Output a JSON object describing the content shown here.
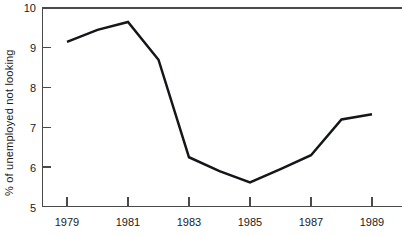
{
  "chart_data": {
    "type": "line",
    "title": "",
    "subtitle": "",
    "xlabel": "",
    "ylabel": "% of unemployed not looking",
    "xlim": [
      1978.5,
      1989.8
    ],
    "ylim": [
      5,
      10
    ],
    "grid": false,
    "legend": "none",
    "x_tick_labels": [
      "1979",
      "1981",
      "1983",
      "1985",
      "1987",
      "1989"
    ],
    "x_tick_values": [
      1979,
      1981,
      1983,
      1985,
      1987,
      1989
    ],
    "y_tick_labels": [
      "5",
      "6",
      "7",
      "8",
      "9",
      "10"
    ],
    "y_tick_values": [
      5,
      6,
      7,
      8,
      9,
      10
    ],
    "series": [
      {
        "name": "% of unemployed not looking",
        "color": "#15161a",
        "x": [
          1979,
          1980,
          1981,
          1982,
          1983,
          1984,
          1985,
          1986,
          1987,
          1988,
          1989
        ],
        "values": [
          9.15,
          9.45,
          9.65,
          8.7,
          6.25,
          5.9,
          5.62,
          5.95,
          6.3,
          7.2,
          7.33
        ]
      }
    ]
  },
  "axes": {
    "y_axis_label": "% of unemployed not looking",
    "y_ticks": [
      {
        "label": "10",
        "value": 10
      },
      {
        "label": "9",
        "value": 9
      },
      {
        "label": "8",
        "value": 8
      },
      {
        "label": "7",
        "value": 7
      },
      {
        "label": "6",
        "value": 6
      },
      {
        "label": "5",
        "value": 5
      }
    ],
    "x_ticks": [
      {
        "label": "1979",
        "value": 1979
      },
      {
        "label": "1981",
        "value": 1981
      },
      {
        "label": "1983",
        "value": 1983
      },
      {
        "label": "1985",
        "value": 1985
      },
      {
        "label": "1987",
        "value": 1987
      },
      {
        "label": "1989",
        "value": 1989
      }
    ]
  },
  "colors": {
    "line": "#15161a",
    "axis": "#4a4a4a",
    "text": "#1a1a1a",
    "background": "#ffffff"
  }
}
